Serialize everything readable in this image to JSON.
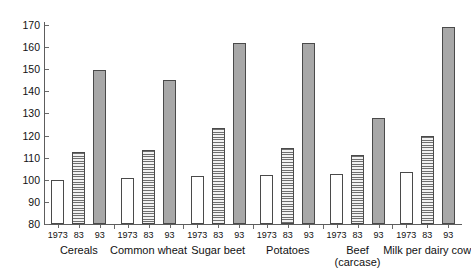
{
  "chart_data": {
    "type": "bar",
    "title": "",
    "subtitle": "",
    "xlabel": "",
    "ylabel": "",
    "ylim": [
      80,
      170
    ],
    "ytick_step": 10,
    "ytick_labels": [
      "170",
      "160",
      "150",
      "140",
      "130",
      "120",
      "110",
      "100",
      "90",
      "80"
    ],
    "ytick_values": [
      170,
      160,
      150,
      140,
      130,
      120,
      110,
      100,
      90,
      80
    ],
    "grid": false,
    "legend": "none",
    "categories": [
      "Cereals",
      "Common wheat",
      "Sugar beet",
      "Potatoes",
      "Beef (carcase)",
      "Milk per dairy cow"
    ],
    "series": [
      {
        "name": "1973",
        "fill": "open",
        "values": [
          100,
          101,
          101.5,
          102,
          102.5,
          103.5
        ]
      },
      {
        "name": "83",
        "fill": "hatch",
        "values": [
          112.5,
          113.5,
          123.5,
          114.5,
          111,
          120
        ]
      },
      {
        "name": "93",
        "fill": "solid",
        "values": [
          149.5,
          145,
          162,
          162,
          128,
          169
        ]
      }
    ],
    "groups": [
      {
        "label": "Cereals",
        "label_line2": "",
        "bars": [
          {
            "year": "1973",
            "value": 100,
            "fill": "open"
          },
          {
            "year": "83",
            "value": 112.5,
            "fill": "hatch"
          },
          {
            "year": "93",
            "value": 149.5,
            "fill": "solid"
          }
        ]
      },
      {
        "label": "Common wheat",
        "label_line2": "",
        "bars": [
          {
            "year": "1973",
            "value": 101,
            "fill": "open"
          },
          {
            "year": "83",
            "value": 113.5,
            "fill": "hatch"
          },
          {
            "year": "93",
            "value": 145,
            "fill": "solid"
          }
        ]
      },
      {
        "label": "Sugar beet",
        "label_line2": "",
        "bars": [
          {
            "year": "1973",
            "value": 101.5,
            "fill": "open"
          },
          {
            "year": "83",
            "value": 123.5,
            "fill": "hatch"
          },
          {
            "year": "93",
            "value": 162,
            "fill": "solid"
          }
        ]
      },
      {
        "label": "Potatoes",
        "label_line2": "",
        "bars": [
          {
            "year": "1973",
            "value": 102,
            "fill": "open"
          },
          {
            "year": "83",
            "value": 114.5,
            "fill": "hatch"
          },
          {
            "year": "93",
            "value": 162,
            "fill": "solid"
          }
        ]
      },
      {
        "label": "Beef",
        "label_line2": "(carcase)",
        "bars": [
          {
            "year": "1973",
            "value": 102.5,
            "fill": "open"
          },
          {
            "year": "83",
            "value": 111,
            "fill": "hatch"
          },
          {
            "year": "93",
            "value": 128,
            "fill": "solid"
          }
        ]
      },
      {
        "label": "Milk per dairy cow",
        "label_line2": "",
        "bars": [
          {
            "year": "1973",
            "value": 103.5,
            "fill": "open"
          },
          {
            "year": "83",
            "value": 120,
            "fill": "hatch"
          },
          {
            "year": "93",
            "value": 169,
            "fill": "solid"
          }
        ]
      }
    ]
  },
  "colors": {
    "axis": "#5d5d5d",
    "bar_open": "#ffffff",
    "bar_hatch": "#6f6f6f",
    "bar_solid": "#a8a8a8",
    "bar_border": "#4a4a4a",
    "background": "#ffffff",
    "text": "#111111"
  }
}
